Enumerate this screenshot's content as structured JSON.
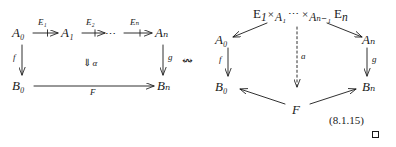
{
  "figure": {
    "kind": "commutative-diagram-pair",
    "equation_number": "(8.1.15)",
    "qed_symbol": "tombstone",
    "background_color": "#ffffff",
    "ink_color": "#1a1a1a",
    "connector": {
      "glyph": "↭",
      "name": "wavy-double-headed-arrow",
      "meaning": "corresponds-to"
    }
  },
  "left_diagram": {
    "name": "square-with-2-cell",
    "top_row": {
      "objects": [
        "A₀",
        "A₁",
        "Aₙ"
      ],
      "ellipsis": "⋯",
      "arrow_labels": [
        "E₁",
        "E₂",
        "Eₙ"
      ],
      "arrow_style": "tick-arrow"
    },
    "bottom_row": {
      "objects": [
        "B₀",
        "Bₙ"
      ],
      "arrow_label": "F",
      "arrow_style": "plain"
    },
    "left_vertical": {
      "label": "f",
      "direction": "down"
    },
    "right_vertical": {
      "label": "g",
      "direction": "down"
    },
    "two_cell": {
      "glyph": "⇓",
      "label": "α"
    }
  },
  "right_diagram": {
    "name": "bicartesian-cone",
    "apex_top": {
      "expression_parts": [
        {
          "text": "E",
          "sub": "1"
        },
        {
          "text": "×",
          "sub": "A₁",
          "kind": "fiber-product"
        },
        {
          "text": "⋯",
          "sub": "",
          "kind": "ellipsis"
        },
        {
          "text": "×",
          "sub": "Aₙ₋₁",
          "kind": "fiber-product"
        },
        {
          "text": "E",
          "sub": "n"
        }
      ],
      "plain": "E₁ ×_{A₁} ⋯ ×_{Aₙ₋₁} Eₙ"
    },
    "apex_bottom": {
      "label": "F"
    },
    "corners": {
      "top_left": "A₀",
      "top_right": "Aₙ",
      "bottom_left": "B₀",
      "bottom_right": "Bₙ"
    },
    "left_vertical": {
      "label": "f",
      "direction": "down"
    },
    "right_vertical": {
      "label": "g",
      "direction": "down"
    },
    "center_vertical": {
      "label": "a",
      "direction": "down",
      "style": "dashed"
    },
    "diagonals": [
      {
        "from": "apex_top",
        "to": "top_left",
        "direction": "down-left"
      },
      {
        "from": "apex_top",
        "to": "top_right",
        "direction": "down-right"
      },
      {
        "from": "apex_bottom",
        "to": "bottom_left",
        "direction": "up-left"
      },
      {
        "from": "apex_bottom",
        "to": "bottom_right",
        "direction": "up-right"
      }
    ]
  }
}
